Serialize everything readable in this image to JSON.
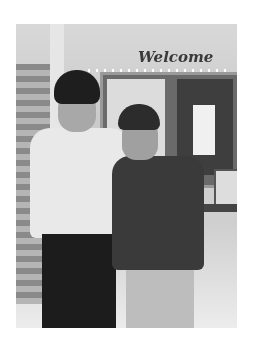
{
  "image": {
    "description": "Black-and-white photo of two young men standing together in a school hallway",
    "sign_text": "Welcome",
    "colors": {
      "background": "#ffffff",
      "photo_tone": "grayscale"
    }
  }
}
